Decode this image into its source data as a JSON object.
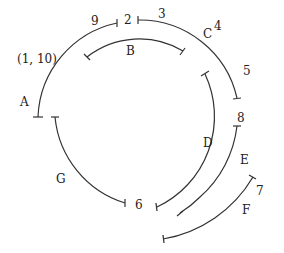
{
  "diagram": {
    "stroke_color": "#333333",
    "arcs": [
      {
        "name": "A",
        "label": "A"
      },
      {
        "name": "B",
        "label": "B"
      },
      {
        "name": "C",
        "label": "C"
      },
      {
        "name": "D",
        "label": "D"
      },
      {
        "name": "E",
        "label": "E"
      },
      {
        "name": "F",
        "label": "F"
      },
      {
        "name": "G",
        "label": "G"
      }
    ],
    "points": {
      "p9": "9",
      "p2": "2",
      "p3": "3",
      "p4": "4",
      "p5": "5",
      "p8": "8",
      "p7": "7",
      "p6": "6",
      "p110": "(1, 10)"
    }
  }
}
